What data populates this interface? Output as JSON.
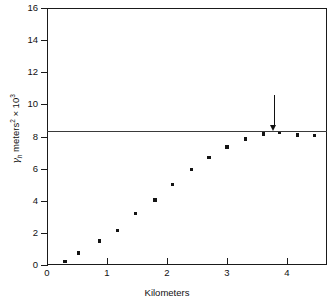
{
  "chart_data": {
    "type": "scatter",
    "title": "",
    "xlabel": "Kilometers",
    "ylabel": "γh meters² × 10³",
    "ylabel_parts": {
      "symbol": "γ",
      "subscript": "h",
      "middle": " meters",
      "sup1": "2",
      "times": " × 10",
      "sup2": "3"
    },
    "xlim": [
      0,
      4.667
    ],
    "ylim": [
      0,
      16
    ],
    "xticks": [
      0,
      1,
      2,
      3,
      4
    ],
    "xtick_labels": [
      "0",
      "1",
      "2",
      "3",
      "4"
    ],
    "yticks": [
      0,
      2,
      4,
      6,
      8,
      10,
      12,
      14,
      16
    ],
    "ytick_labels": [
      "0",
      "2",
      "4",
      "6",
      "8",
      "10",
      "12",
      "14",
      "16"
    ],
    "grid": false,
    "legend": false,
    "marker": "square",
    "marker_color": "#141414",
    "series": [
      {
        "name": "semivariogram",
        "x": [
          0.3,
          0.52,
          0.88,
          1.17,
          1.48,
          1.8,
          2.09,
          2.41,
          2.7,
          3.0,
          3.31,
          3.61,
          3.88,
          4.18,
          4.46
        ],
        "y": [
          0.2,
          0.75,
          1.5,
          2.15,
          3.2,
          4.05,
          5.0,
          5.95,
          6.7,
          7.35,
          7.85,
          8.15,
          8.25,
          8.1,
          8.05
        ]
      }
    ],
    "reference_line": {
      "name": "sill",
      "orientation": "horizontal",
      "value": 8.35,
      "color": "#3a3a3a",
      "x_start": 0,
      "x_end": 4.667
    },
    "annotations": [
      {
        "name": "range-arrow",
        "type": "down-arrow",
        "x": 3.78,
        "y_top": 10.6,
        "y_tip": 8.7,
        "color": "#111111"
      }
    ]
  }
}
